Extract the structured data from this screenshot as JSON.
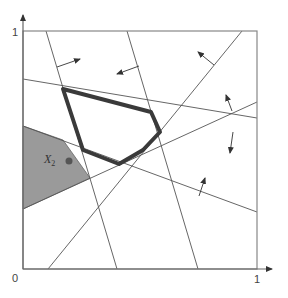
{
  "diagram": {
    "type": "linear-programming-feasible-region",
    "axes": {
      "x_tick_labels": [
        {
          "text": "0",
          "x": 12,
          "y": 273
        },
        {
          "text": "1",
          "x": 254,
          "y": 274
        }
      ],
      "y_tick_labels": [
        {
          "text": "1",
          "x": 12,
          "y": 27
        }
      ],
      "frame": {
        "x1": 23,
        "y1": 31,
        "x2": 257,
        "y2": 269
      },
      "x_arrow_end": 272,
      "y_arrow_top": 15
    },
    "colors": {
      "frame": "#888888",
      "axis": "#666666",
      "line": "#555555",
      "polygon_stroke": "#3a3a3a",
      "shaded_fill": "#9a9a9a",
      "shaded_stroke": "#666666",
      "point": "#555555",
      "arrow": "#333333"
    },
    "constraint_lines": [
      {
        "id": "line-1",
        "x1": 46,
        "y1": 31,
        "x2": 117,
        "y2": 269
      },
      {
        "id": "line-2",
        "x1": 127,
        "y1": 31,
        "x2": 198,
        "y2": 269
      },
      {
        "id": "line-3",
        "x1": 242,
        "y1": 31,
        "x2": 48,
        "y2": 269
      },
      {
        "id": "line-4",
        "x1": 23,
        "y1": 79,
        "x2": 257,
        "y2": 118
      },
      {
        "id": "line-5",
        "x1": 23,
        "y1": 209,
        "x2": 257,
        "y2": 102
      },
      {
        "id": "line-6",
        "x1": 23,
        "y1": 126,
        "x2": 257,
        "y2": 212
      }
    ],
    "normal_arrows": [
      {
        "id": "arrow-1",
        "x1": 57,
        "y1": 67,
        "x2": 80,
        "y2": 59
      },
      {
        "id": "arrow-2",
        "x1": 139,
        "y1": 66,
        "x2": 117,
        "y2": 74
      },
      {
        "id": "arrow-3",
        "x1": 214,
        "y1": 65,
        "x2": 198,
        "y2": 52
      },
      {
        "id": "arrow-4",
        "x1": 232,
        "y1": 111,
        "x2": 226,
        "y2": 95
      },
      {
        "id": "arrow-5",
        "x1": 233,
        "y1": 132,
        "x2": 230,
        "y2": 153
      },
      {
        "id": "arrow-6",
        "x1": 199,
        "y1": 196,
        "x2": 205,
        "y2": 178
      }
    ],
    "feasible_polygon": {
      "label": "feasible region",
      "points": [
        [
          63,
          89
        ],
        [
          151,
          112
        ],
        [
          160,
          132
        ],
        [
          143,
          150
        ],
        [
          119,
          164
        ],
        [
          83,
          150
        ]
      ]
    },
    "shaded_region": {
      "label": "X2 region",
      "points": [
        [
          23,
          126
        ],
        [
          63,
          140
        ],
        [
          90,
          178
        ],
        [
          23,
          209
        ]
      ]
    },
    "point": {
      "label_main": "X",
      "label_sub": "2",
      "label_x": 44,
      "label_y": 153,
      "cx": 69,
      "cy": 161,
      "r": 3.5
    }
  }
}
